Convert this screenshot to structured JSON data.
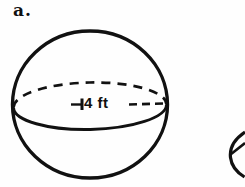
{
  "page": {
    "background_color": "#fefefe",
    "ink_color": "#111111"
  },
  "figure": {
    "label": "a.",
    "shape": "sphere",
    "dimension_label": "4 ft",
    "dimension_meaning": "radius"
  }
}
